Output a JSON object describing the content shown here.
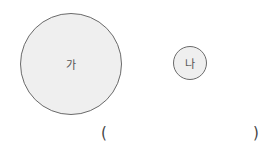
{
  "figure": {
    "circles": [
      {
        "label": "가",
        "size": "large"
      },
      {
        "label": "나",
        "size": "small"
      }
    ],
    "answer_blank": {
      "open": "(",
      "close": ")"
    }
  }
}
